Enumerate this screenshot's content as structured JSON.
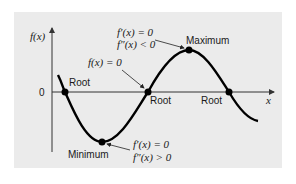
{
  "diagram": {
    "title": "",
    "axes": {
      "y_label": "f(x)",
      "x_label": "x",
      "zero_label": "0"
    },
    "points": {
      "root1": {
        "label": "Root"
      },
      "root2": {
        "label": "Root"
      },
      "root3": {
        "label": "Root"
      },
      "maximum": {
        "label": "Maximum"
      },
      "minimum": {
        "label": "Minimum"
      }
    },
    "annotations": {
      "root_condition": "f(x) = 0",
      "max_condition_1": "f′(x) = 0",
      "max_condition_2": "f″(x) < 0",
      "min_condition_1": "f′(x) = 0",
      "min_condition_2": "f″(x) > 0"
    },
    "colors": {
      "panel_background": "#ebebeb",
      "curve": "#000000",
      "axis": "#333333"
    }
  }
}
